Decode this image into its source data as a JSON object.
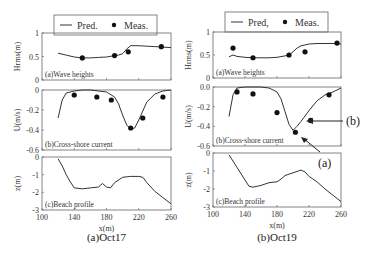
{
  "figure": {
    "legend": {
      "left": {
        "pred": "Pred.",
        "meas": "Meas."
      },
      "right": {
        "pred": "Pred,",
        "meas": "Meas."
      }
    },
    "captions": [
      "(a)Oct17",
      "(b)Oct19"
    ],
    "xlabel": "x(m)",
    "xticks": [
      "100",
      "140",
      "180",
      "220",
      "260"
    ],
    "subplots": {
      "a": {
        "title": "(a)Wave heights",
        "ylabel": "Hrms(m)",
        "yticks": [
          "1",
          "0.5",
          "0"
        ]
      },
      "b": {
        "title": "(b)Cross-shore current",
        "ylabel": "U(m/s)",
        "yticks_left": [
          "0",
          "-0.2",
          "-0.4",
          "-0.6"
        ],
        "yticks_right": [
          "0.0",
          "-0.2",
          "-0.4",
          "-0.6"
        ]
      },
      "c": {
        "title": "(c)Beach profile",
        "ylabel": "z(m)",
        "yticks": [
          "0",
          "-1",
          "-2",
          "-3"
        ]
      }
    },
    "annotations": {
      "a": "(a)",
      "b": "(b)"
    }
  },
  "chart_data": [
    {
      "type": "line",
      "title": "(a)Oct17 - (a)Wave heights",
      "xlabel": "x(m)",
      "ylabel": "Hrms(m)",
      "xlim": [
        100,
        260
      ],
      "ylim": [
        0,
        1
      ],
      "series": [
        {
          "name": "Pred.",
          "x": [
            120,
            130,
            140,
            150,
            160,
            170,
            180,
            190,
            195,
            200,
            205,
            210,
            220,
            230,
            240,
            250,
            260
          ],
          "y": [
            0.57,
            0.53,
            0.49,
            0.47,
            0.47,
            0.48,
            0.49,
            0.52,
            0.53,
            0.56,
            0.66,
            0.73,
            0.73,
            0.72,
            0.71,
            0.7,
            0.69
          ]
        },
        {
          "name": "Meas.",
          "x": [
            150,
            190,
            207,
            248
          ],
          "y": [
            0.47,
            0.52,
            0.6,
            0.71
          ]
        }
      ]
    },
    {
      "type": "line",
      "title": "(a)Oct17 - (b)Cross-shore current",
      "xlabel": "x(m)",
      "ylabel": "U(m/s)",
      "xlim": [
        100,
        260
      ],
      "ylim": [
        -0.6,
        0
      ],
      "series": [
        {
          "name": "Pred.",
          "x": [
            120,
            125,
            130,
            140,
            150,
            160,
            170,
            180,
            190,
            195,
            200,
            205,
            210,
            215,
            220,
            230,
            240,
            250,
            260
          ],
          "y": [
            -0.28,
            -0.1,
            -0.03,
            -0.01,
            0,
            0,
            -0.01,
            -0.02,
            -0.07,
            -0.14,
            -0.25,
            -0.35,
            -0.39,
            -0.38,
            -0.3,
            -0.12,
            -0.04,
            -0.01,
            0
          ]
        },
        {
          "name": "Meas.",
          "x": [
            140,
            168,
            186,
            210,
            225,
            250
          ],
          "y": [
            -0.05,
            -0.07,
            -0.1,
            -0.38,
            -0.28,
            -0.07
          ]
        }
      ]
    },
    {
      "type": "line",
      "title": "(a)Oct17 - (c)Beach profile",
      "xlabel": "x(m)",
      "ylabel": "z(m)",
      "xlim": [
        100,
        260
      ],
      "ylim": [
        -3,
        0
      ],
      "series": [
        {
          "name": "Profile",
          "x": [
            120,
            125,
            130,
            135,
            140,
            150,
            160,
            170,
            175,
            180,
            185,
            190,
            200,
            210,
            220,
            225,
            230,
            240,
            250,
            260
          ],
          "y": [
            -0.1,
            -0.5,
            -1.0,
            -1.4,
            -1.75,
            -1.8,
            -1.75,
            -1.7,
            -1.5,
            -1.7,
            -1.75,
            -1.45,
            -1.15,
            -1.1,
            -1.1,
            -1.15,
            -1.45,
            -1.95,
            -2.3,
            -2.65
          ]
        }
      ]
    },
    {
      "type": "line",
      "title": "(b)Oct19 - (a)Wave heights",
      "xlabel": "x(m)",
      "ylabel": "Hrms(m)",
      "xlim": [
        100,
        260
      ],
      "ylim": [
        0,
        1
      ],
      "series": [
        {
          "name": "Pred.",
          "x": [
            120,
            125,
            130,
            140,
            150,
            160,
            170,
            180,
            190,
            195,
            200,
            205,
            210,
            220,
            230,
            240,
            250,
            260
          ],
          "y": [
            0.46,
            0.5,
            0.47,
            0.45,
            0.44,
            0.44,
            0.44,
            0.45,
            0.48,
            0.5,
            0.57,
            0.65,
            0.7,
            0.74,
            0.75,
            0.75,
            0.75,
            0.74
          ]
        },
        {
          "name": "Meas.",
          "x": [
            125,
            150,
            195,
            215,
            255
          ],
          "y": [
            0.65,
            0.44,
            0.5,
            0.57,
            0.76
          ]
        }
      ]
    },
    {
      "type": "line",
      "title": "(b)Oct19 - (b)Cross-shore current",
      "xlabel": "x(m)",
      "ylabel": "U(m/s)",
      "xlim": [
        100,
        260
      ],
      "ylim": [
        -0.6,
        0
      ],
      "series": [
        {
          "name": "Pred.",
          "x": [
            120,
            125,
            130,
            140,
            150,
            160,
            170,
            180,
            185,
            190,
            195,
            200,
            205,
            210,
            220,
            230,
            240,
            250,
            260
          ],
          "y": [
            -0.3,
            -0.08,
            -0.01,
            0,
            0,
            0,
            -0.01,
            -0.05,
            -0.12,
            -0.25,
            -0.38,
            -0.44,
            -0.4,
            -0.35,
            -0.24,
            -0.14,
            -0.08,
            -0.05,
            -0.01
          ]
        },
        {
          "name": "Meas.",
          "x": [
            130,
            150,
            180,
            203,
            222,
            245
          ],
          "y": [
            -0.05,
            -0.07,
            -0.26,
            -0.46,
            -0.34,
            -0.08
          ]
        }
      ]
    },
    {
      "type": "line",
      "title": "(b)Oct19 - (c)Beach profile",
      "xlabel": "x(m)",
      "ylabel": "z(m)",
      "xlim": [
        100,
        260
      ],
      "ylim": [
        -3,
        0
      ],
      "series": [
        {
          "name": "Profile",
          "x": [
            120,
            130,
            140,
            145,
            150,
            160,
            170,
            180,
            185,
            190,
            200,
            210,
            215,
            220,
            230,
            240,
            250,
            260
          ],
          "y": [
            -0.1,
            -0.8,
            -1.5,
            -1.85,
            -1.9,
            -1.8,
            -1.65,
            -1.6,
            -1.45,
            -1.25,
            -1.1,
            -0.95,
            -1.05,
            -1.3,
            -1.6,
            -2.0,
            -2.35,
            -2.7
          ]
        }
      ]
    }
  ]
}
